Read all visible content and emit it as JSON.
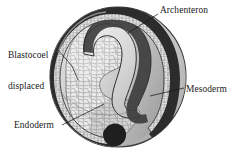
{
  "figure": {
    "background_color": "#ffffff",
    "ink_color": "#1a1a1a"
  },
  "labels": {
    "archenteron": "Archenteron",
    "blastocoel_line1": "Blastocoel",
    "blastocoel_line2": "displaced",
    "mesoderm": "Mesoderm",
    "endoderm": "Endoderm"
  },
  "structures": {
    "outer_surface": "ectoderm-surface",
    "archenteron_cavity": "archenteron",
    "blastocoel_remnant": "blastocoel-displaced",
    "mesoderm_layer": "mesoderm-layer",
    "endoderm_mass": "endoderm-cell-mass",
    "blastopore": "blastopore"
  },
  "colors": {
    "rim_dark": "#2b2b2b",
    "mesoderm_dark": "#3a3a3a",
    "cell_fill": "#e9e9e9",
    "cell_line": "#8d8d8d",
    "sphere_light": "#f2f2f2",
    "sphere_mid": "#c9c9c9",
    "sphere_shadow": "#9a9a9a",
    "cavity_fill": "#dcdcdc"
  }
}
